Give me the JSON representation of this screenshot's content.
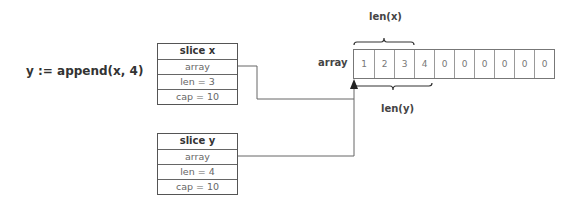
{
  "statement": "y := append(x, 4)",
  "slices": [
    {
      "title": "slice x",
      "fields": [
        "array",
        "len = 3",
        "cap = 10"
      ]
    },
    {
      "title": "slice y",
      "fields": [
        "array",
        "len = 4",
        "cap = 10"
      ]
    }
  ],
  "array": {
    "label": "array",
    "cells": [
      "1",
      "2",
      "3",
      "4",
      "0",
      "0",
      "0",
      "0",
      "0",
      "0"
    ]
  },
  "braces": {
    "top_label": "len(x)",
    "bottom_label": "len(y)"
  },
  "colors": {
    "line": "#555555",
    "text": "#333333",
    "cell_text": "#777777"
  }
}
